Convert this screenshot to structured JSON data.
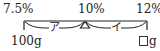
{
  "diagram": {
    "type": "balance-beam",
    "top_labels": {
      "left": "7.5%",
      "center": "10%",
      "right": "12%"
    },
    "bottom_labels": {
      "left": "100g",
      "right_unit": "g",
      "right_blank": "□"
    },
    "arm_labels": {
      "left": "ア",
      "right": "イ"
    },
    "colors": {
      "ink": "#222222",
      "background": "#ffffff"
    }
  }
}
